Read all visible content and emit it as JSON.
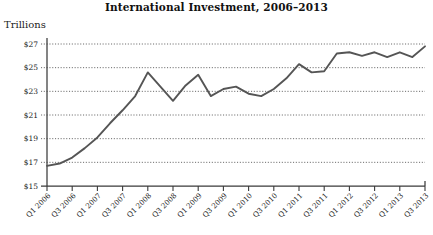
{
  "chart_data": {
    "type": "line",
    "title": "International Investment, 2006–2013",
    "xlabel": "",
    "ylabel": "Trillions",
    "ylim": [
      15,
      27
    ],
    "yticks": [
      15,
      17,
      19,
      21,
      23,
      25,
      27
    ],
    "ytick_labels": [
      "$15",
      "$17",
      "$19",
      "$21",
      "$23",
      "$25",
      "$27"
    ],
    "grid": true,
    "legend": "none",
    "line_color": "#555555",
    "x": [
      "Q1 2006",
      "Q2 2006",
      "Q3 2006",
      "Q4 2006",
      "Q1 2007",
      "Q2 2007",
      "Q3 2007",
      "Q4 2007",
      "Q1 2008",
      "Q2 2008",
      "Q3 2008",
      "Q4 2008",
      "Q1 2009",
      "Q2 2009",
      "Q3 2009",
      "Q4 2009",
      "Q1 2010",
      "Q2 2010",
      "Q3 2010",
      "Q4 2010",
      "Q1 2011",
      "Q2 2011",
      "Q3 2011",
      "Q4 2011",
      "Q1 2012",
      "Q2 2012",
      "Q3 2012",
      "Q4 2012",
      "Q1 2013",
      "Q2 2013",
      "Q3 2013"
    ],
    "xtick_labels": [
      "Q1 2006",
      "Q3 2006",
      "Q1 2007",
      "Q3 2007",
      "Q1 2008",
      "Q3 2008",
      "Q1 2009",
      "Q3 2009",
      "Q1 2010",
      "Q3 2010",
      "Q1 2011",
      "Q3 2011",
      "Q1 2012",
      "Q3 2012",
      "Q1 2013",
      "Q3 2013"
    ],
    "values": [
      16.7,
      16.9,
      17.4,
      18.2,
      19.1,
      20.3,
      21.4,
      22.6,
      24.6,
      23.4,
      22.2,
      23.5,
      24.4,
      22.6,
      23.2,
      23.4,
      22.8,
      22.6,
      23.2,
      24.1,
      25.3,
      24.6,
      24.7,
      26.2,
      26.3,
      26.0,
      26.3,
      25.9,
      26.3,
      25.9,
      26.8
    ],
    "values_label_unit": "trillions of dollars"
  }
}
